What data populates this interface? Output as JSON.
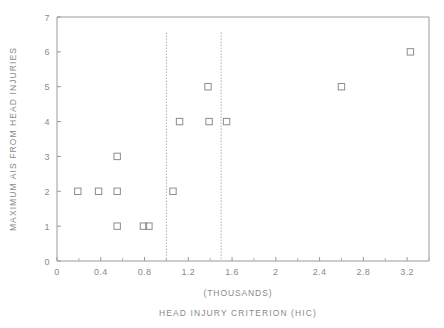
{
  "chart_data": {
    "type": "scatter",
    "title": "",
    "xlabel": "HEAD INJURY CRITERION (HIC)",
    "xlabel_units": "(THOUSANDS)",
    "ylabel": "MAXIMUM AIS FROM HEAD INJURIES",
    "xlim": [
      0,
      3.4
    ],
    "ylim": [
      0,
      7
    ],
    "grid": false,
    "legend": "none",
    "xticks": [
      0,
      0.4,
      0.8,
      1.2,
      1.6,
      2,
      2.4,
      2.8,
      3.2
    ],
    "xtick_labels": [
      "0",
      "0.4",
      "0.8",
      "1.2",
      "1.6",
      "2",
      "2.4",
      "2.8",
      "3.2"
    ],
    "xticks_minor": [
      0.2,
      0.6,
      1.0,
      1.4,
      1.8,
      2.2,
      2.6,
      3.0,
      3.4
    ],
    "yticks": [
      0,
      1,
      2,
      3,
      4,
      5,
      6,
      7
    ],
    "ytick_labels": [
      "0",
      "1",
      "2",
      "3",
      "4",
      "5",
      "6",
      "7"
    ],
    "marker": "open-square",
    "marker_color": "#8c8c8c",
    "points": [
      {
        "x": 0.19,
        "y": 2
      },
      {
        "x": 0.38,
        "y": 2
      },
      {
        "x": 0.55,
        "y": 3
      },
      {
        "x": 0.55,
        "y": 2
      },
      {
        "x": 0.55,
        "y": 1
      },
      {
        "x": 0.79,
        "y": 1
      },
      {
        "x": 0.84,
        "y": 1
      },
      {
        "x": 1.06,
        "y": 2
      },
      {
        "x": 1.12,
        "y": 4
      },
      {
        "x": 1.38,
        "y": 5
      },
      {
        "x": 1.39,
        "y": 4
      },
      {
        "x": 1.55,
        "y": 4
      },
      {
        "x": 2.6,
        "y": 5
      },
      {
        "x": 3.23,
        "y": 6
      }
    ],
    "reference_lines": [
      {
        "orientation": "vertical",
        "x": 1.0,
        "style": "dotted",
        "y_top": 6.55
      },
      {
        "orientation": "vertical",
        "x": 1.5,
        "style": "dotted",
        "y_top": 6.55
      }
    ]
  }
}
